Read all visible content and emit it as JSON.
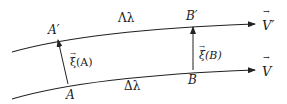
{
  "diagram": {
    "type": "geodesic-deviation",
    "curves": [
      {
        "id": "upper",
        "label": "Λλ",
        "end_vector": "V′",
        "points": [
          "A′",
          "B′"
        ]
      },
      {
        "id": "lower",
        "label": "Δλ",
        "end_vector": "V",
        "points": [
          "A",
          "B"
        ]
      }
    ],
    "labels": {
      "A_prime": "A′",
      "B_prime": "B′",
      "A": "A",
      "B": "B",
      "upper_param": "Λλ",
      "lower_param": "Δλ",
      "xi_A": "ξ(A)",
      "xi_B": "ξ(B)",
      "V_prime": "V′",
      "V": "V",
      "vec_arrow": "→"
    },
    "connecting_vectors": [
      {
        "from": "A",
        "to": "A′",
        "label": "ξ(A)"
      },
      {
        "from": "B",
        "to": "B′",
        "label": "ξ(B)"
      }
    ],
    "colors": {
      "stroke": "#222222",
      "background": "#ffffff"
    }
  }
}
